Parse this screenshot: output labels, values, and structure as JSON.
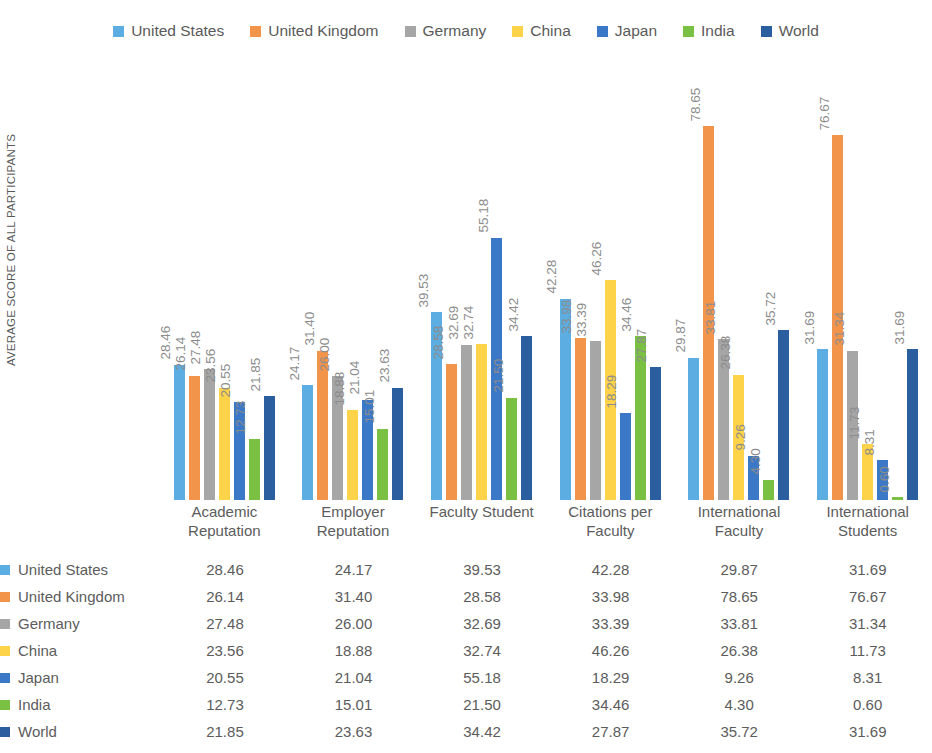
{
  "chart_data": {
    "type": "bar",
    "title": "",
    "subtitle": "",
    "xlabel": "",
    "ylabel": "AVERAGE SCORE OF ALL PARTICIPANTS",
    "ylim": [
      0,
      80
    ],
    "grid": false,
    "legend_position": "top",
    "categories": [
      "Academic Reputation",
      "Employer Reputation",
      "Faculty Student",
      "Citations per Faculty",
      "International Faculty",
      "International Students"
    ],
    "category_lines": [
      [
        "Academic",
        "Reputation"
      ],
      [
        "Employer",
        "Reputation"
      ],
      [
        "Faculty Student",
        ""
      ],
      [
        "Citations per",
        "Faculty"
      ],
      [
        "International",
        "Faculty"
      ],
      [
        "International",
        "Students"
      ]
    ],
    "series": [
      {
        "name": "United States",
        "color": "#5CADE2",
        "values": [
          28.46,
          24.17,
          39.53,
          42.28,
          29.87,
          31.69
        ]
      },
      {
        "name": "United Kingdom",
        "color": "#F2944A",
        "values": [
          26.14,
          31.4,
          28.58,
          33.98,
          78.65,
          76.67
        ]
      },
      {
        "name": "Germany",
        "color": "#A6A6A6",
        "values": [
          27.48,
          26.0,
          32.69,
          33.39,
          33.81,
          31.34
        ]
      },
      {
        "name": "China",
        "color": "#FCD349",
        "values": [
          23.56,
          18.88,
          32.74,
          46.26,
          26.38,
          11.73
        ]
      },
      {
        "name": "Japan",
        "color": "#3C78C8",
        "values": [
          20.55,
          21.04,
          55.18,
          18.29,
          9.26,
          8.31
        ]
      },
      {
        "name": "India",
        "color": "#7AC143",
        "values": [
          12.73,
          15.01,
          21.5,
          34.46,
          4.3,
          0.6
        ]
      },
      {
        "name": "World",
        "color": "#2B5E9E",
        "values": [
          21.85,
          23.63,
          34.42,
          27.87,
          35.72,
          31.69
        ]
      }
    ],
    "value_labels": [
      [
        "28.46",
        "26.14",
        "27.48",
        "23.56",
        "20.55",
        "12.73",
        "21.85"
      ],
      [
        "24.17",
        "31.40",
        "26.00",
        "18.88",
        "21.04",
        "15.01",
        "23.63"
      ],
      [
        "39.53",
        "28.58",
        "32.69",
        "32.74",
        "55.18",
        "21.50",
        "34.42"
      ],
      [
        "42.28",
        "33.98",
        "33.39",
        "46.26",
        "18.29",
        "34.46",
        "27.87"
      ],
      [
        "29.87",
        "78.65",
        "33.81",
        "26.38",
        "9.26",
        "4.30",
        "35.72"
      ],
      [
        "31.69",
        "76.67",
        "31.34",
        "11.73",
        "8.31",
        "0.60",
        "31.69"
      ]
    ]
  },
  "legend": {
    "items": [
      {
        "label": "United States",
        "color": "#5CADE2"
      },
      {
        "label": "United Kingdom",
        "color": "#F2944A"
      },
      {
        "label": "Germany",
        "color": "#A6A6A6"
      },
      {
        "label": "China",
        "color": "#FCD349"
      },
      {
        "label": "Japan",
        "color": "#3C78C8"
      },
      {
        "label": "India",
        "color": "#7AC143"
      },
      {
        "label": "World",
        "color": "#2B5E9E"
      }
    ]
  },
  "table": {
    "rows": [
      {
        "name": "United States",
        "color": "#5CADE2",
        "values": [
          "28.46",
          "24.17",
          "39.53",
          "42.28",
          "29.87",
          "31.69"
        ]
      },
      {
        "name": "United Kingdom",
        "color": "#F2944A",
        "values": [
          "26.14",
          "31.40",
          "28.58",
          "33.98",
          "78.65",
          "76.67"
        ]
      },
      {
        "name": "Germany",
        "color": "#A6A6A6",
        "values": [
          "27.48",
          "26.00",
          "32.69",
          "33.39",
          "33.81",
          "31.34"
        ]
      },
      {
        "name": "China",
        "color": "#FCD349",
        "values": [
          "23.56",
          "18.88",
          "32.74",
          "46.26",
          "26.38",
          "11.73"
        ]
      },
      {
        "name": "Japan",
        "color": "#3C78C8",
        "values": [
          "20.55",
          "21.04",
          "55.18",
          "18.29",
          "9.26",
          "8.31"
        ]
      },
      {
        "name": "India",
        "color": "#7AC143",
        "values": [
          "12.73",
          "15.01",
          "21.50",
          "34.46",
          "4.30",
          "0.60"
        ]
      },
      {
        "name": "World",
        "color": "#2B5E9E",
        "values": [
          "21.85",
          "23.63",
          "34.42",
          "27.87",
          "35.72",
          "31.69"
        ]
      }
    ]
  }
}
